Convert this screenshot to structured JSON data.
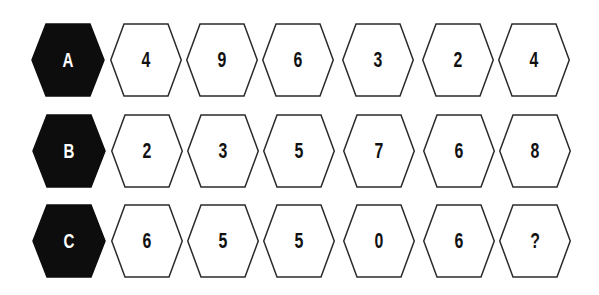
{
  "puzzle": {
    "type": "hexagon-number-sequence",
    "colors": {
      "label_fill": "#0d0d0d",
      "label_text": "#ffffff",
      "cell_fill": "#ffffff",
      "cell_stroke": "#2a2a2a",
      "cell_text": "#111111"
    },
    "rows": [
      {
        "label": "A",
        "values": [
          "4",
          "9",
          "6",
          "3",
          "2",
          "4"
        ]
      },
      {
        "label": "B",
        "values": [
          "2",
          "3",
          "5",
          "7",
          "6",
          "8"
        ]
      },
      {
        "label": "C",
        "values": [
          "6",
          "5",
          "5",
          "0",
          "6",
          "?"
        ]
      }
    ]
  }
}
